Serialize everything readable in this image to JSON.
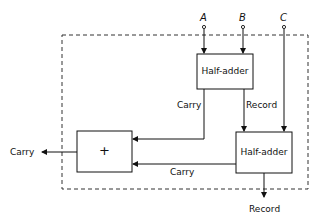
{
  "diagram": {
    "type": "full-adder block diagram",
    "inputs": [
      {
        "id": "A",
        "label": "A"
      },
      {
        "id": "B",
        "label": "B"
      },
      {
        "id": "C",
        "label": "C"
      }
    ],
    "blocks": {
      "half_adder_top": {
        "label": "Half-adder"
      },
      "half_adder_bottom": {
        "label": "Half-adder"
      },
      "or_block": {
        "label": "+"
      }
    },
    "edge_labels": {
      "top_carry": "Carry",
      "top_record": "Record",
      "bottom_carry": "Carry",
      "out_carry": "Carry",
      "out_record": "Record"
    },
    "colors": {
      "line": "#111111",
      "background": "#ffffff",
      "dashed_boundary": "#333333"
    }
  }
}
